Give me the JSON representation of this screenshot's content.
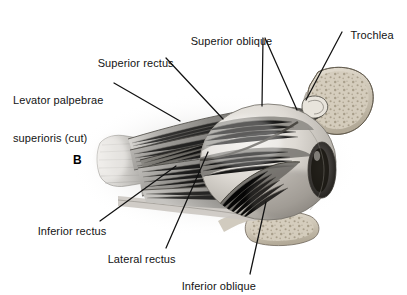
{
  "figure": {
    "panel_letter": "B",
    "background_color": "#ffffff",
    "line_color": "#111111"
  },
  "labels": [
    {
      "id": "superior-oblique",
      "text": "Superior oblique",
      "lines": [
        "Superior oblique"
      ],
      "x": 178,
      "y": 28,
      "align": "left",
      "leaders": [
        {
          "x1": 263,
          "y1": 38,
          "x2": 262,
          "y2": 106
        },
        {
          "x1": 265,
          "y1": 38,
          "x2": 297,
          "y2": 110
        }
      ]
    },
    {
      "id": "trochlea",
      "text": "Trochlea",
      "lines": [
        "Trochlea"
      ],
      "x": 340,
      "y": 22,
      "align": "left",
      "leaders": [
        {
          "x1": 342,
          "y1": 32,
          "x2": 306,
          "y2": 100
        }
      ]
    },
    {
      "id": "superior-rectus",
      "text": "Superior rectus",
      "lines": [
        "Superior rectus"
      ],
      "x": 86,
      "y": 49,
      "align": "left",
      "leaders": [
        {
          "x1": 166,
          "y1": 58,
          "x2": 223,
          "y2": 119
        }
      ]
    },
    {
      "id": "levator-palpebrae-superioris",
      "text": "Levator palpebrae superioris (cut)",
      "lines": [
        "Levator palpebrae",
        "superioris (cut)"
      ],
      "x": 14,
      "y": 74,
      "align": "left",
      "leaders": [
        {
          "x1": 114,
          "y1": 83,
          "x2": 180,
          "y2": 121
        }
      ]
    },
    {
      "id": "inferior-rectus",
      "text": "Inferior rectus",
      "lines": [
        "Inferior rectus"
      ],
      "x": 26,
      "y": 217,
      "align": "left",
      "leaders": [
        {
          "x1": 100,
          "y1": 221,
          "x2": 176,
          "y2": 166
        }
      ]
    },
    {
      "id": "lateral-rectus",
      "text": "Lateral rectus",
      "lines": [
        "Lateral rectus"
      ],
      "x": 96,
      "y": 245,
      "align": "left",
      "leaders": [
        {
          "x1": 166,
          "y1": 248,
          "x2": 208,
          "y2": 152
        }
      ]
    },
    {
      "id": "inferior-oblique",
      "text": "Inferior oblique",
      "lines": [
        "Inferior oblique"
      ],
      "x": 170,
      "y": 272,
      "align": "left",
      "leaders": [
        {
          "x1": 250,
          "y1": 274,
          "x2": 266,
          "y2": 202
        }
      ]
    }
  ]
}
